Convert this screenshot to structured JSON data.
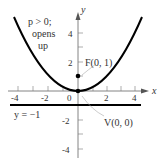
{
  "diagram": {
    "type": "parabola",
    "equation_note": "x^2 = 4py, p = 1",
    "annotation_lines": [
      "p > 0;",
      "opens",
      "up"
    ],
    "axes": {
      "x_label": "x",
      "y_label": "y",
      "x_ticks": [
        "-4",
        "-2",
        "0",
        "2",
        "4"
      ],
      "y_ticks": [
        "4",
        "2",
        "-2",
        "-4"
      ]
    },
    "focus_label": "F(0, 1)",
    "vertex_label": "V(0, 0)",
    "directrix_label": "y = −1",
    "colors": {
      "curve": "#000000",
      "axis": "#666666",
      "text": "#333333",
      "leader": "#999999"
    }
  }
}
